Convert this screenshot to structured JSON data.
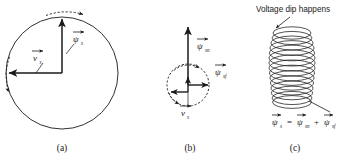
{
  "figure": {
    "title_annotation": "Voltage dip happens",
    "panels": [
      {
        "id": "a",
        "caption": "(a)",
        "labels": [
          {
            "name": "flux-vector",
            "symbol": "ψ",
            "subscript": "s",
            "arrow": "vector"
          },
          {
            "name": "voltage-vector",
            "symbol": "v",
            "subscript": "s",
            "arrow": "vector"
          }
        ],
        "shapes": {
          "main_circle": "large-solid-circle",
          "top_arc": "dashed-arc-with-arrow",
          "left_arc": "dashed-arc-with-arrow"
        }
      },
      {
        "id": "b",
        "caption": "(b)",
        "labels": [
          {
            "name": "natural-flux-vector",
            "symbol": "ψ",
            "subscript": "sn",
            "arrow": "vector"
          },
          {
            "name": "forced-flux-vector",
            "symbol": "ψ",
            "subscript": "sf",
            "arrow": "vector"
          },
          {
            "name": "voltage-vector",
            "symbol": "v",
            "subscript": "s",
            "arrow": "vector"
          }
        ],
        "shapes": {
          "main_circle": "small-dashed-circle",
          "top_arc": "dashed-arc-with-arrow",
          "bottom_arc": "dashed-arc-with-arrow"
        }
      },
      {
        "id": "c",
        "caption": "(c)",
        "equation": {
          "lhs": {
            "symbol": "ψ",
            "subscript": "s"
          },
          "equals": "=",
          "term1": {
            "symbol": "ψ",
            "subscript": "sn"
          },
          "plus": "+",
          "term2": {
            "symbol": "ψ",
            "subscript": "sf"
          }
        },
        "shapes": {
          "spiral": "coil-of-overlapping-ellipses",
          "leader_top": "arrow-to-spiral-top",
          "leader_bottom": "line-to-equation"
        }
      }
    ],
    "colors": {
      "ink": "#1a1a1a",
      "background": "#ffffff"
    }
  }
}
